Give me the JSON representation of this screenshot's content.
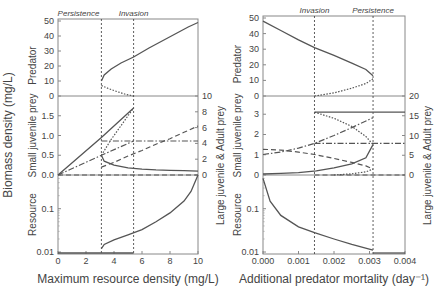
{
  "chart_data": [
    {
      "type": "line",
      "id": "left",
      "xlabel": "Maximum resource density (mg/L)",
      "ylabel_shared": "Biomass density (mg/L)",
      "xlim": [
        0,
        10
      ],
      "xticks": [
        "0",
        "2",
        "4",
        "6",
        "8",
        "10"
      ],
      "annotations": [
        {
          "text": "Persistence",
          "x": 3.1
        },
        {
          "text": "Invasion",
          "x": 5.4
        }
      ],
      "panels": {
        "predator": {
          "label": "Predator",
          "ylim": [
            0,
            50
          ],
          "yticks": [
            "0",
            "10",
            "20",
            "30",
            "40",
            "50"
          ],
          "series": [
            {
              "name": "stable",
              "style": "solid",
              "x": [
                3.1,
                3.3,
                3.8,
                4.5,
                5.4,
                6.5,
                7.5,
                8.5,
                9.3,
                10
              ],
              "y": [
                10,
                14,
                18,
                22,
                26,
                32,
                37,
                42,
                46,
                49
              ]
            },
            {
              "name": "unstable",
              "style": "dotted",
              "x": [
                3.1,
                3.6,
                4.2,
                4.8,
                5.4
              ],
              "y": [
                7,
                5,
                3,
                1.2,
                0
              ]
            }
          ]
        },
        "prey": {
          "label_left": "Small juvenile prey",
          "label_right": "Large juvenile & Adult prey",
          "ylim_left": [
            0,
            2
          ],
          "yticks_left": [
            "0.0",
            "0.5",
            "1.0",
            "1.5"
          ],
          "ylim_right": [
            0,
            10
          ],
          "yticks_right": [
            "0",
            "2",
            "4",
            "6",
            "8",
            "10"
          ],
          "series": [
            {
              "name": "small-juv-no-predator",
              "axis": "left",
              "style": "solid",
              "x": [
                0,
                3.1,
                5.4
              ],
              "y": [
                0,
                0.95,
                1.7
              ]
            },
            {
              "name": "small-juv-stable",
              "axis": "left",
              "style": "solid",
              "x": [
                3.1,
                3.3,
                4,
                5,
                6,
                7,
                8,
                9,
                10
              ],
              "y": [
                0.5,
                0.35,
                0.25,
                0.18,
                0.15,
                0.13,
                0.12,
                0.11,
                0.1
              ]
            },
            {
              "name": "small-juv-unstable",
              "axis": "left",
              "style": "dotted",
              "x": [
                3.1,
                3.8,
                4.6,
                5.4
              ],
              "y": [
                0.5,
                0.9,
                1.3,
                1.7
              ]
            },
            {
              "name": "large-juv-no-predator",
              "axis": "right",
              "style": "dashdot",
              "x": [
                0,
                3.1,
                5.4
              ],
              "y": [
                0,
                2.5,
                4.3
              ]
            },
            {
              "name": "large-juv-stable",
              "axis": "right",
              "style": "dashdot",
              "x": [
                3.1,
                10
              ],
              "y": [
                4.3,
                4.3
              ]
            },
            {
              "name": "adult-stable",
              "axis": "right",
              "style": "dashed",
              "x": [
                3.1,
                4,
                5,
                6,
                7,
                8,
                9,
                10
              ],
              "y": [
                1.0,
                1.6,
                2.4,
                3.1,
                3.9,
                4.6,
                5.4,
                6.2
              ]
            },
            {
              "name": "adult-no-predator",
              "axis": "right",
              "style": "dashed",
              "x": [
                0,
                10
              ],
              "y": [
                0,
                0
              ]
            }
          ]
        },
        "resource": {
          "label": "Resource",
          "scale": "log",
          "ylim": [
            0.009,
            0.6
          ],
          "yticks": [
            "0.01",
            "0.1"
          ],
          "series": [
            {
              "name": "stable",
              "style": "solid",
              "x": [
                3.1,
                3.3,
                4,
                5,
                6,
                7,
                8,
                9,
                9.5,
                10
              ],
              "y": [
                0.012,
                0.015,
                0.019,
                0.025,
                0.033,
                0.05,
                0.08,
                0.15,
                0.25,
                0.6
              ]
            },
            {
              "name": "no-predator",
              "style": "solid",
              "x": [
                0,
                5.4
              ],
              "y": [
                0.0095,
                0.0095
              ]
            }
          ]
        }
      }
    },
    {
      "type": "line",
      "id": "right",
      "xlabel": "Additional predator mortality (day⁻¹)",
      "xlim": [
        0,
        0.004
      ],
      "xticks": [
        "0.000",
        "0.001",
        "0.002",
        "0.003",
        "0.004"
      ],
      "annotations": [
        {
          "text": "Invasion",
          "x": 0.00145
        },
        {
          "text": "Persistence",
          "x": 0.0031
        }
      ],
      "panels": {
        "predator": {
          "label": "Predator",
          "ylim": [
            0,
            50
          ],
          "yticks": [
            "0",
            "10",
            "20",
            "30",
            "40",
            "50"
          ],
          "series": [
            {
              "name": "stable",
              "style": "solid",
              "x": [
                0,
                0.0005,
                0.001,
                0.00145,
                0.002,
                0.0025,
                0.0029,
                0.0031
              ],
              "y": [
                48,
                42,
                36,
                31,
                26,
                21,
                17,
                13
              ]
            },
            {
              "name": "unstable",
              "style": "dotted",
              "x": [
                0.00145,
                0.002,
                0.0025,
                0.0029,
                0.0031
              ],
              "y": [
                0,
                2,
                5,
                8,
                11
              ]
            }
          ]
        },
        "prey": {
          "label_left": "Small juvenile prey",
          "label_right": "Large juvenile & Adult prey",
          "ylim_left": [
            0,
            3.9
          ],
          "yticks_left": [
            "0",
            "1",
            "2",
            "3"
          ],
          "ylim_right": [
            0,
            20
          ],
          "yticks_right": [
            "0",
            "5",
            "10",
            "15",
            "20"
          ],
          "series": [
            {
              "name": "small-juv-stable",
              "axis": "left",
              "style": "solid",
              "x": [
                0,
                0.0005,
                0.001,
                0.0015,
                0.002,
                0.0025,
                0.0029,
                0.0031
              ],
              "y": [
                0.05,
                0.08,
                0.12,
                0.2,
                0.35,
                0.55,
                0.85,
                1.5
              ]
            },
            {
              "name": "small-juv-no-predator",
              "axis": "left",
              "style": "solid",
              "x": [
                0.00145,
                0.004
              ],
              "y": [
                3.1,
                3.1
              ]
            },
            {
              "name": "small-juv-unstable",
              "axis": "left",
              "style": "dotted",
              "x": [
                0.00145,
                0.002,
                0.0025,
                0.0029,
                0.0031
              ],
              "y": [
                3.1,
                2.8,
                2.4,
                1.9,
                1.5
              ]
            },
            {
              "name": "large-juv-stable",
              "axis": "right",
              "style": "dashdot",
              "x": [
                0,
                0.0005,
                0.001,
                0.00145,
                0.002,
                0.0025,
                0.0031
              ],
              "y": [
                5.2,
                5.8,
                6.8,
                8,
                10,
                12,
                14.5
              ]
            },
            {
              "name": "large-juv-no-predator",
              "axis": "right",
              "style": "dashdot",
              "x": [
                0.00145,
                0.004
              ],
              "y": [
                8,
                8
              ]
            },
            {
              "name": "adult-stable",
              "axis": "right",
              "style": "dashed",
              "x": [
                0,
                0.0005,
                0.001,
                0.00145,
                0.002,
                0.0025,
                0.0029,
                0.0031
              ],
              "y": [
                6.5,
                6.3,
                5.8,
                5.2,
                4.2,
                3.2,
                2.3,
                1.5
              ]
            },
            {
              "name": "adult-no-predator",
              "axis": "right",
              "style": "dashed",
              "x": [
                0.00145,
                0.004
              ],
              "y": [
                0,
                0
              ]
            },
            {
              "name": "unstable-lower",
              "axis": "right",
              "style": "dotted",
              "x": [
                0.002,
                0.0025,
                0.0029,
                0.0031
              ],
              "y": [
                0,
                0.3,
                0.8,
                1.5
              ]
            }
          ]
        },
        "resource": {
          "label": "Resource",
          "scale": "log",
          "ylim": [
            0.009,
            0.6
          ],
          "yticks": [
            "0.01",
            "0.1"
          ],
          "series": [
            {
              "name": "stable",
              "style": "solid",
              "x": [
                0,
                0.0002,
                0.0005,
                0.001,
                0.00145,
                0.002,
                0.0025,
                0.0031
              ],
              "y": [
                0.5,
                0.15,
                0.07,
                0.038,
                0.028,
                0.02,
                0.015,
                0.011
              ]
            },
            {
              "name": "no-predator",
              "style": "solid",
              "x": [
                0.0031,
                0.004
              ],
              "y": [
                0.0095,
                0.0095
              ]
            }
          ]
        }
      }
    }
  ]
}
